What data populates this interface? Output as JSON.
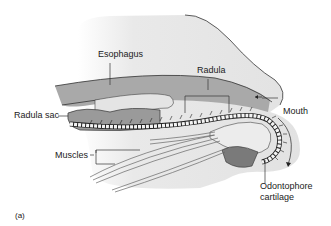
{
  "figure": {
    "panel_label": "(a)",
    "labels": {
      "esophagus": "Esophagus",
      "radula": "Radula",
      "radula_sac": "Radula sac",
      "mouth": "Mouth",
      "muscles": "Muscles",
      "odontophore_line1": "Odontophore",
      "odontophore_line2": "cartilage"
    },
    "colors": {
      "body": "#e6e6e6",
      "tube": "#a8a8a8",
      "dark": "#777777",
      "outline": "#333333"
    }
  }
}
